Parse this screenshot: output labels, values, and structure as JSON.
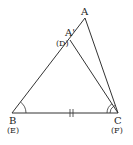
{
  "diagram": {
    "type": "congruent-triangles-overlay",
    "stroke_color": "#333333",
    "background": "#ffffff",
    "vertices": {
      "A": {
        "label": "A",
        "x": 85,
        "y": 18
      },
      "A2": {
        "label": "A'",
        "x": 70,
        "y": 40
      },
      "B": {
        "label": "B",
        "x": 12,
        "y": 113
      },
      "C": {
        "label": "C",
        "x": 118,
        "y": 113
      }
    },
    "labels": {
      "A": "A",
      "A_prime": "A'",
      "D": "(D)",
      "B": "B",
      "E": "(E)",
      "C": "C",
      "F": "(F)"
    },
    "segments": [
      {
        "from": "B",
        "to": "A"
      },
      {
        "from": "A",
        "to": "C"
      },
      {
        "from": "A2",
        "to": "C"
      },
      {
        "from": "B",
        "to": "C",
        "mark": "double-tick"
      }
    ],
    "angle_marks": [
      {
        "vertex": "B",
        "arcs": 1
      },
      {
        "vertex": "C",
        "arcs": 2
      }
    ]
  }
}
